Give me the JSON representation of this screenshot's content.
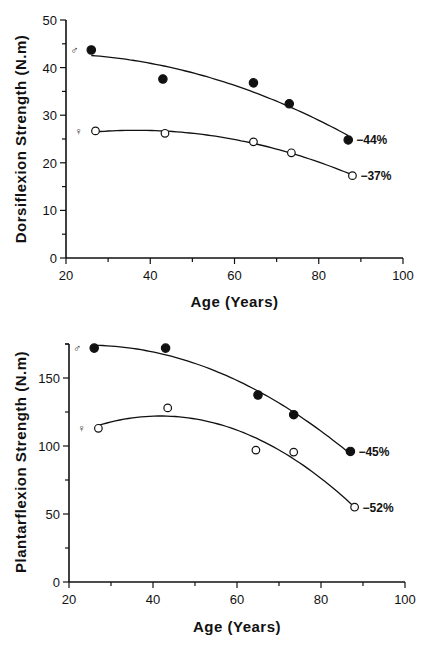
{
  "chart_data": [
    {
      "type": "scatter",
      "title": "",
      "xlabel": "Age (Years)",
      "ylabel": "Dorsiflexion Strength (N.m)",
      "xlim": [
        20,
        100
      ],
      "ylim": [
        0,
        50
      ],
      "x_ticks": [
        "20",
        "40",
        "60",
        "80",
        "100"
      ],
      "y_ticks": [
        "0",
        "10",
        "20",
        "30",
        "40",
        "50"
      ],
      "grid": false,
      "legend": "symbols at left: ♂ filled, ♀ open",
      "series": [
        {
          "name": "♂ (male)",
          "marker": "filled-circle",
          "x": [
            26,
            43,
            64.5,
            73,
            87
          ],
          "y": [
            43.7,
            37.6,
            36.8,
            32.4,
            24.8
          ],
          "fit": "quadratic",
          "annotation": "−44%"
        },
        {
          "name": "♀ (female)",
          "marker": "open-circle",
          "x": [
            27,
            43.5,
            64.5,
            73.5,
            88
          ],
          "y": [
            26.7,
            26.2,
            24.4,
            22.1,
            17.3
          ],
          "fit": "quadratic",
          "annotation": "−37%"
        }
      ]
    },
    {
      "type": "scatter",
      "title": "",
      "xlabel": "Age (Years)",
      "ylabel": "Plantarflexion Strength (N.m)",
      "xlim": [
        20,
        100
      ],
      "ylim": [
        0,
        175
      ],
      "x_ticks": [
        "20",
        "40",
        "60",
        "80",
        "100"
      ],
      "y_ticks": [
        "0",
        "50",
        "100",
        "150"
      ],
      "grid": false,
      "legend": "symbols at left: ♂ filled, ♀ open",
      "series": [
        {
          "name": "♂ (male)",
          "marker": "filled-circle",
          "x": [
            26,
            43,
            65,
            73.5,
            87
          ],
          "y": [
            172,
            172,
            137.5,
            123,
            96
          ],
          "fit": "quadratic",
          "annotation": "−45%"
        },
        {
          "name": "♀ (female)",
          "marker": "open-circle",
          "x": [
            27,
            43.5,
            64.5,
            73.5,
            88
          ],
          "y": [
            113,
            128,
            97,
            95.5,
            55
          ],
          "fit": "quadratic",
          "annotation": "−52%"
        }
      ]
    }
  ],
  "labels": {
    "male_symbol": "♂",
    "female_symbol": "♀"
  }
}
